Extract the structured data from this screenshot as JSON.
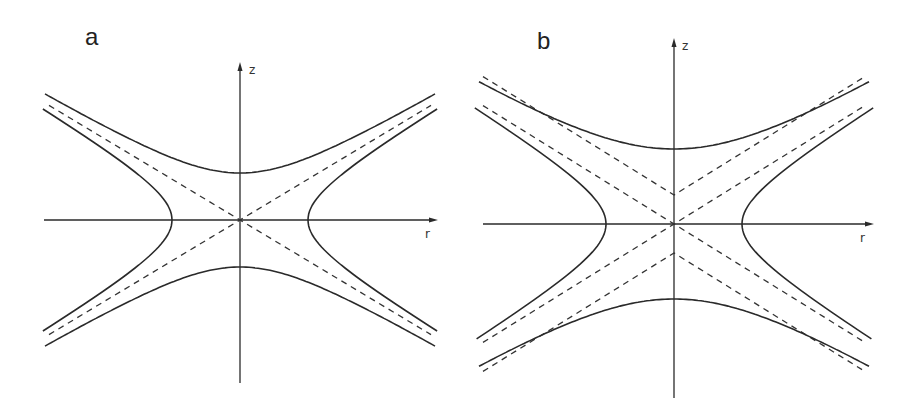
{
  "figure": {
    "background": "#ffffff",
    "ink_color": "#2a2a2a",
    "panels": [
      {
        "id": "a",
        "label": "a",
        "label_pos": [
          85,
          45
        ],
        "origin": [
          240,
          220
        ],
        "axes": {
          "z_label": "z",
          "r_label": "r",
          "z_axis": {
            "y_top": 62,
            "y_bottom": 383
          },
          "r_axis": {
            "x_left": 44,
            "x_right": 438
          },
          "z_label_pos": [
            249,
            74
          ],
          "r_label_pos": [
            425,
            238
          ]
        },
        "asymptote_slope": 0.6,
        "dashed_offsets": [
          0
        ],
        "hyperbola_axial_vertex": 47,
        "hyperbola_radial_vertex": 68,
        "extent_r": 195
      },
      {
        "id": "b",
        "label": "b",
        "label_pos": [
          537,
          49
        ],
        "origin": [
          674,
          224
        ],
        "axes": {
          "z_label": "z",
          "r_label": "r",
          "z_axis": {
            "y_top": 38,
            "y_bottom": 398
          },
          "r_axis": {
            "x_left": 483,
            "x_right": 874
          },
          "z_label_pos": [
            682,
            50
          ],
          "r_label_pos": [
            860,
            242
          ]
        },
        "asymptote_slope": 0.62,
        "dashed_offsets": [
          0,
          29,
          -29
        ],
        "hyperbola_axial_vertex": 75,
        "hyperbola_radial_vertex": 68,
        "extent_r": 195
      }
    ]
  }
}
